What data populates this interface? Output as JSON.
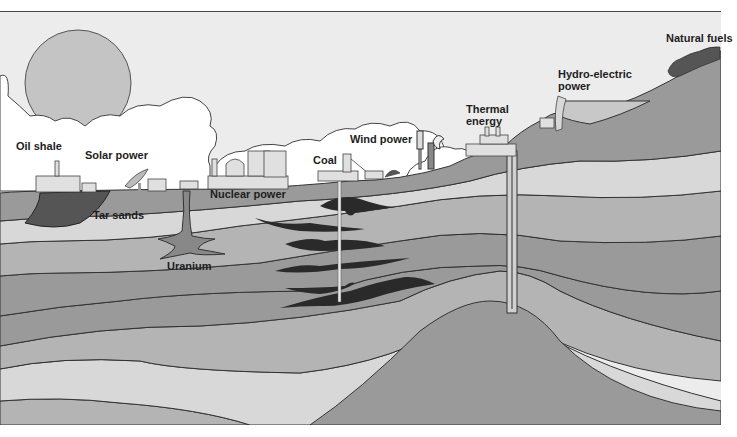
{
  "diagram": {
    "type": "cross-section",
    "labels": {
      "natural_fuels": "Natural fuels",
      "hydro_electric": "Hydro-electric",
      "hydro_power": "power",
      "thermal": "Thermal",
      "thermal_energy": "energy",
      "wind_power": "Wind power",
      "coal": "Coal",
      "oil_shale": "Oil shale",
      "solar_power": "Solar power",
      "nuclear_power": "Nuclear power",
      "tar_sands": "Tar sands",
      "uranium": "Uranium"
    },
    "colors": {
      "sky": "#ececec",
      "cloud": "#ffffff",
      "sun": "#c4c4c4",
      "layer_dark": "#9a9a9a",
      "layer_mid": "#b4b4b4",
      "layer_light": "#d8d8d8",
      "coal_seam": "#2a2a2a",
      "outline": "#3a3a3a"
    }
  }
}
